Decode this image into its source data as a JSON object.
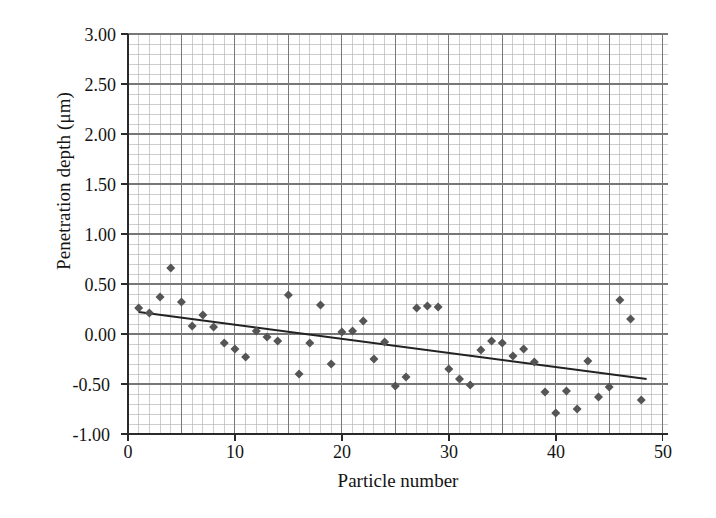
{
  "chart_data": {
    "type": "scatter",
    "title": "",
    "xlabel": "Particle number",
    "ylabel": "Penetration depth (μm)",
    "xlim": [
      0,
      50.5
    ],
    "ylim": [
      -1.0,
      3.0
    ],
    "xticks": [
      0,
      10,
      20,
      30,
      40,
      50
    ],
    "xtick_labels": [
      "0",
      "10",
      "20",
      "30",
      "40",
      "50"
    ],
    "yticks": [
      -1.0,
      -0.5,
      0.0,
      0.5,
      1.0,
      1.5,
      2.0,
      2.5,
      3.0
    ],
    "ytick_labels": [
      "-1.00",
      "-0.50",
      "0.00",
      "0.50",
      "1.00",
      "1.50",
      "2.00",
      "2.50",
      "3.00"
    ],
    "grid": true,
    "grid_major_x_step": 5,
    "grid_major_y_step": 0.5,
    "grid_minor_x_step": 1,
    "grid_minor_y_step": 0.1,
    "legend": null,
    "marker": "diamond",
    "marker_color": "#555555",
    "marker_size": 9,
    "series": [
      {
        "name": "Penetration depth",
        "points": [
          {
            "x": 1,
            "y": 0.26
          },
          {
            "x": 2,
            "y": 0.21
          },
          {
            "x": 3,
            "y": 0.37
          },
          {
            "x": 4,
            "y": 0.66
          },
          {
            "x": 5,
            "y": 0.32
          },
          {
            "x": 6,
            "y": 0.08
          },
          {
            "x": 7,
            "y": 0.19
          },
          {
            "x": 8,
            "y": 0.07
          },
          {
            "x": 9,
            "y": -0.09
          },
          {
            "x": 10,
            "y": -0.15
          },
          {
            "x": 11,
            "y": -0.23
          },
          {
            "x": 12,
            "y": 0.03
          },
          {
            "x": 13,
            "y": -0.03
          },
          {
            "x": 14,
            "y": -0.07
          },
          {
            "x": 15,
            "y": 0.39
          },
          {
            "x": 16,
            "y": -0.4
          },
          {
            "x": 17,
            "y": -0.09
          },
          {
            "x": 18,
            "y": 0.29
          },
          {
            "x": 19,
            "y": -0.3
          },
          {
            "x": 20,
            "y": 0.02
          },
          {
            "x": 21,
            "y": 0.03
          },
          {
            "x": 22,
            "y": 0.13
          },
          {
            "x": 23,
            "y": -0.25
          },
          {
            "x": 24,
            "y": -0.08
          },
          {
            "x": 25,
            "y": -0.52
          },
          {
            "x": 26,
            "y": -0.43
          },
          {
            "x": 27,
            "y": 0.26
          },
          {
            "x": 28,
            "y": 0.28
          },
          {
            "x": 29,
            "y": 0.27
          },
          {
            "x": 30,
            "y": -0.35
          },
          {
            "x": 31,
            "y": -0.45
          },
          {
            "x": 32,
            "y": -0.51
          },
          {
            "x": 33,
            "y": -0.16
          },
          {
            "x": 34,
            "y": -0.07
          },
          {
            "x": 35,
            "y": -0.09
          },
          {
            "x": 36,
            "y": -0.22
          },
          {
            "x": 37,
            "y": -0.15
          },
          {
            "x": 38,
            "y": -0.28
          },
          {
            "x": 39,
            "y": -0.58
          },
          {
            "x": 40,
            "y": -0.79
          },
          {
            "x": 41,
            "y": -0.57
          },
          {
            "x": 42,
            "y": -0.75
          },
          {
            "x": 43,
            "y": -0.27
          },
          {
            "x": 44,
            "y": -0.63
          },
          {
            "x": 45,
            "y": -0.53
          },
          {
            "x": 46,
            "y": 0.34
          },
          {
            "x": 47,
            "y": 0.15
          },
          {
            "x": 48,
            "y": -0.66
          }
        ]
      }
    ],
    "trendline": {
      "type": "linear",
      "x_start": 1,
      "y_start": 0.22,
      "x_end": 48.5,
      "y_end": -0.45,
      "color": "#222222"
    }
  }
}
